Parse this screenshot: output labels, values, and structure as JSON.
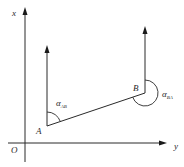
{
  "diagram": {
    "type": "coordinate-azimuth-diagram",
    "axes": {
      "vertical_label": "x",
      "horizontal_label": "y",
      "origin_label": "O"
    },
    "points": [
      {
        "name": "A",
        "label": "A"
      },
      {
        "name": "B",
        "label": "B"
      }
    ],
    "angles": [
      {
        "symbol": "α",
        "subscript": "AB",
        "at": "A",
        "description": "angle from north direction at A clockwise to line AB"
      },
      {
        "symbol": "α",
        "subscript": "BA",
        "at": "B",
        "description": "angle from north direction at B clockwise to line BA"
      }
    ],
    "colors": {
      "stroke": "#2a2a2a",
      "background": "#ffffff"
    }
  }
}
